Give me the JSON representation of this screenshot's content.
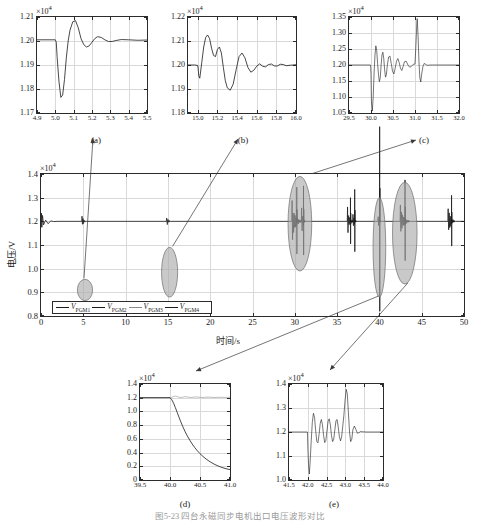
{
  "figure": {
    "caption": "图5-23 四台永磁同步电机出口电压波形对比",
    "panel_labels": {
      "a": "(a)",
      "b": "(b)",
      "c": "(c)",
      "d": "(d)",
      "e": "(e)"
    }
  },
  "main": {
    "xlabel": "时间/s",
    "ylabel": "电压/V",
    "exponent": "×10",
    "exponent_sup": "4",
    "legend": [
      {
        "label": "V",
        "sub": "PGM1"
      },
      {
        "label": "V",
        "sub": "PGM2"
      },
      {
        "label": "V",
        "sub": "PGM3"
      },
      {
        "label": "V",
        "sub": "PGM4"
      }
    ]
  },
  "chart_data": [
    {
      "type": "line",
      "name": "main",
      "title": "",
      "xlabel": "时间/s",
      "ylabel": "电压/V",
      "y_exponent": 10000,
      "xlim": [
        0,
        50
      ],
      "ylim": [
        0.8,
        1.4
      ],
      "xticks": [
        0,
        5,
        10,
        15,
        20,
        25,
        30,
        35,
        40,
        45,
        50
      ],
      "yticks": [
        0.8,
        0.9,
        1.0,
        1.1,
        1.2,
        1.3,
        1.4
      ],
      "grid": true,
      "legend_position": "lower-left",
      "series": [
        {
          "name": "V_PGM1",
          "nominal": 1.2
        },
        {
          "name": "V_PGM2",
          "nominal": 1.2
        },
        {
          "name": "V_PGM3",
          "nominal": 1.2
        },
        {
          "name": "V_PGM4",
          "nominal": 1.2
        }
      ],
      "steady_value": 1.2,
      "disturbance_events_s": [
        0.2,
        5.05,
        15.1,
        30.2,
        31.0,
        36.5,
        37.0,
        40.0,
        43.0,
        48.5
      ],
      "annotations": [
        {
          "shape": "ellipse",
          "cx": 5.2,
          "cy": 0.91,
          "rx": 0.9,
          "ry": 0.045,
          "links_to": "(a)"
        },
        {
          "shape": "ellipse",
          "cx": 15.2,
          "cy": 0.985,
          "rx": 0.95,
          "ry": 0.105,
          "links_to": "(b)"
        },
        {
          "shape": "ellipse",
          "cx": 30.6,
          "cy": 1.19,
          "rx": 1.4,
          "ry": 0.2,
          "links_to": "(c)"
        },
        {
          "shape": "ellipse",
          "cx": 40.0,
          "cy": 1.09,
          "rx": 0.75,
          "ry": 0.21,
          "links_to": "(d)"
        },
        {
          "shape": "ellipse",
          "cx": 43.0,
          "cy": 1.15,
          "rx": 1.45,
          "ry": 0.215,
          "links_to": "(e)"
        }
      ]
    },
    {
      "type": "line",
      "name": "a",
      "panel": "(a)",
      "xlabel": "",
      "ylabel": "",
      "y_exponent": 10000,
      "xlim": [
        4.9,
        5.5
      ],
      "ylim": [
        1.17,
        1.21
      ],
      "xticks": [
        4.9,
        5.0,
        5.1,
        5.2,
        5.3,
        5.4,
        5.5
      ],
      "yticks": [
        1.17,
        1.18,
        1.19,
        1.2,
        1.21
      ],
      "grid": true,
      "points": [
        [
          4.9,
          1.2005
        ],
        [
          4.96,
          1.2005
        ],
        [
          5.0,
          1.2005
        ],
        [
          5.005,
          1.1995
        ],
        [
          5.01,
          1.193
        ],
        [
          5.02,
          1.183
        ],
        [
          5.03,
          1.1765
        ],
        [
          5.04,
          1.1775
        ],
        [
          5.05,
          1.184
        ],
        [
          5.06,
          1.193
        ],
        [
          5.07,
          1.2
        ],
        [
          5.08,
          1.2045
        ],
        [
          5.095,
          1.208
        ],
        [
          5.11,
          1.2085
        ],
        [
          5.125,
          1.2055
        ],
        [
          5.14,
          1.201
        ],
        [
          5.155,
          1.1985
        ],
        [
          5.17,
          1.1975
        ],
        [
          5.185,
          1.198
        ],
        [
          5.2,
          1.1995
        ],
        [
          5.215,
          1.201
        ],
        [
          5.23,
          1.2018
        ],
        [
          5.25,
          1.2015
        ],
        [
          5.27,
          1.2005
        ],
        [
          5.29,
          1.1998
        ],
        [
          5.31,
          1.1998
        ],
        [
          5.33,
          1.2002
        ],
        [
          5.36,
          1.2006
        ],
        [
          5.4,
          1.2005
        ],
        [
          5.45,
          1.2003
        ],
        [
          5.5,
          1.2004
        ]
      ]
    },
    {
      "type": "line",
      "name": "b",
      "panel": "(b)",
      "xlabel": "",
      "ylabel": "",
      "y_exponent": 10000,
      "xlim": [
        14.9,
        16.0
      ],
      "ylim": [
        1.18,
        1.22
      ],
      "xticks": [
        15.0,
        15.2,
        15.4,
        15.6,
        15.8,
        16.0
      ],
      "yticks": [
        1.18,
        1.19,
        1.2,
        1.21,
        1.22
      ],
      "grid": true,
      "points": [
        [
          14.9,
          1.2
        ],
        [
          14.97,
          1.2
        ],
        [
          15.0,
          1.1998
        ],
        [
          15.01,
          1.1955
        ],
        [
          15.02,
          1.1945
        ],
        [
          15.04,
          1.201
        ],
        [
          15.06,
          1.2075
        ],
        [
          15.08,
          1.2115
        ],
        [
          15.1,
          1.2125
        ],
        [
          15.12,
          1.211
        ],
        [
          15.14,
          1.207
        ],
        [
          15.16,
          1.204
        ],
        [
          15.18,
          1.2035
        ],
        [
          15.2,
          1.2065
        ],
        [
          15.22,
          1.2075
        ],
        [
          15.24,
          1.205
        ],
        [
          15.26,
          1.199
        ],
        [
          15.28,
          1.1935
        ],
        [
          15.3,
          1.1905
        ],
        [
          15.33,
          1.1895
        ],
        [
          15.36,
          1.192
        ],
        [
          15.39,
          1.198
        ],
        [
          15.42,
          1.2035
        ],
        [
          15.45,
          1.205
        ],
        [
          15.48,
          1.203
        ],
        [
          15.51,
          1.199
        ],
        [
          15.54,
          1.197
        ],
        [
          15.57,
          1.1978
        ],
        [
          15.6,
          1.1995
        ],
        [
          15.63,
          1.2005
        ],
        [
          15.66,
          1.1995
        ],
        [
          15.69,
          1.1992
        ],
        [
          15.72,
          1.2002
        ],
        [
          15.75,
          1.2004
        ],
        [
          15.78,
          1.1996
        ],
        [
          15.81,
          1.1996
        ],
        [
          15.84,
          1.2003
        ],
        [
          15.87,
          1.2002
        ],
        [
          15.9,
          1.1997
        ],
        [
          15.94,
          1.1999
        ],
        [
          16.0,
          1.2001
        ]
      ]
    },
    {
      "type": "line",
      "name": "c",
      "panel": "(c)",
      "xlabel": "",
      "ylabel": "",
      "y_exponent": 10000,
      "xlim": [
        29.5,
        32.0
      ],
      "ylim": [
        1.05,
        1.35
      ],
      "xticks": [
        29.5,
        30.0,
        30.5,
        31.0,
        31.5,
        32.0
      ],
      "yticks": [
        1.05,
        1.1,
        1.15,
        1.2,
        1.25,
        1.3,
        1.35
      ],
      "grid": true,
      "points": [
        [
          29.5,
          1.2
        ],
        [
          29.9,
          1.2
        ],
        [
          29.99,
          1.2
        ],
        [
          30.0,
          1.17
        ],
        [
          30.01,
          1.085
        ],
        [
          30.03,
          1.056
        ],
        [
          30.05,
          1.1
        ],
        [
          30.07,
          1.175
        ],
        [
          30.09,
          1.23
        ],
        [
          30.11,
          1.26
        ],
        [
          30.13,
          1.245
        ],
        [
          30.15,
          1.205
        ],
        [
          30.17,
          1.17
        ],
        [
          30.19,
          1.148
        ],
        [
          30.21,
          1.16
        ],
        [
          30.23,
          1.2
        ],
        [
          30.25,
          1.232
        ],
        [
          30.27,
          1.24
        ],
        [
          30.29,
          1.22
        ],
        [
          30.31,
          1.185
        ],
        [
          30.33,
          1.162
        ],
        [
          30.35,
          1.17
        ],
        [
          30.37,
          1.198
        ],
        [
          30.4,
          1.225
        ],
        [
          30.43,
          1.228
        ],
        [
          30.46,
          1.205
        ],
        [
          30.49,
          1.18
        ],
        [
          30.52,
          1.172
        ],
        [
          30.55,
          1.19
        ],
        [
          30.58,
          1.212
        ],
        [
          30.61,
          1.22
        ],
        [
          30.64,
          1.208
        ],
        [
          30.67,
          1.19
        ],
        [
          30.7,
          1.183
        ],
        [
          30.73,
          1.195
        ],
        [
          30.76,
          1.21
        ],
        [
          30.8,
          1.212
        ],
        [
          30.84,
          1.2
        ],
        [
          30.88,
          1.193
        ],
        [
          30.92,
          1.196
        ],
        [
          30.96,
          1.202
        ],
        [
          31.0,
          1.203
        ],
        [
          31.02,
          1.26
        ],
        [
          31.04,
          1.325
        ],
        [
          31.05,
          1.345
        ],
        [
          31.07,
          1.29
        ],
        [
          31.09,
          1.21
        ],
        [
          31.11,
          1.16
        ],
        [
          31.13,
          1.147
        ],
        [
          31.15,
          1.17
        ],
        [
          31.18,
          1.195
        ],
        [
          31.21,
          1.205
        ],
        [
          31.24,
          1.202
        ],
        [
          31.28,
          1.199
        ],
        [
          31.33,
          1.1998
        ],
        [
          31.4,
          1.2
        ],
        [
          31.6,
          1.2
        ],
        [
          32.0,
          1.2
        ]
      ]
    },
    {
      "type": "line",
      "name": "d",
      "panel": "(d)",
      "xlabel": "",
      "ylabel": "",
      "y_exponent": 10000,
      "xlim": [
        39.5,
        41.0
      ],
      "ylim": [
        0,
        1.4
      ],
      "xticks": [
        39.5,
        40.0,
        40.5,
        41.0
      ],
      "yticks": [
        0,
        0.2,
        0.4,
        0.6,
        0.8,
        1.0,
        1.2,
        1.4
      ],
      "grid": true,
      "series": [
        {
          "name": "decaying",
          "points": [
            [
              39.5,
              1.2
            ],
            [
              39.8,
              1.2
            ],
            [
              40.0,
              1.2
            ],
            [
              40.03,
              1.17
            ],
            [
              40.06,
              1.12
            ],
            [
              40.09,
              1.055
            ],
            [
              40.12,
              0.985
            ],
            [
              40.15,
              0.915
            ],
            [
              40.18,
              0.848
            ],
            [
              40.21,
              0.785
            ],
            [
              40.25,
              0.708
            ],
            [
              40.29,
              0.64
            ],
            [
              40.33,
              0.58
            ],
            [
              40.37,
              0.525
            ],
            [
              40.41,
              0.476
            ],
            [
              40.45,
              0.432
            ],
            [
              40.5,
              0.384
            ],
            [
              40.55,
              0.343
            ],
            [
              40.6,
              0.307
            ],
            [
              40.65,
              0.276
            ],
            [
              40.7,
              0.249
            ],
            [
              40.75,
              0.225
            ],
            [
              40.8,
              0.205
            ],
            [
              40.85,
              0.188
            ],
            [
              40.9,
              0.173
            ],
            [
              40.95,
              0.161
            ],
            [
              41.0,
              0.152
            ]
          ]
        },
        {
          "name": "sustained",
          "points": [
            [
              39.5,
              1.2
            ],
            [
              39.9,
              1.2
            ],
            [
              40.0,
              1.2
            ],
            [
              40.03,
              1.205
            ],
            [
              40.06,
              1.218
            ],
            [
              40.09,
              1.224
            ],
            [
              40.12,
              1.218
            ],
            [
              40.15,
              1.208
            ],
            [
              40.18,
              1.203
            ],
            [
              40.21,
              1.207
            ],
            [
              40.24,
              1.214
            ],
            [
              40.27,
              1.215
            ],
            [
              40.3,
              1.209
            ],
            [
              40.34,
              1.204
            ],
            [
              40.38,
              1.206
            ],
            [
              40.42,
              1.211
            ],
            [
              40.46,
              1.21
            ],
            [
              40.5,
              1.205
            ],
            [
              40.55,
              1.204
            ],
            [
              40.6,
              1.207
            ],
            [
              40.65,
              1.208
            ],
            [
              40.7,
              1.205
            ],
            [
              40.75,
              1.204
            ],
            [
              40.8,
              1.206
            ],
            [
              40.86,
              1.206
            ],
            [
              40.92,
              1.2045
            ],
            [
              41.0,
              1.205
            ]
          ]
        }
      ]
    },
    {
      "type": "line",
      "name": "e",
      "panel": "(e)",
      "xlabel": "",
      "ylabel": "",
      "y_exponent": 10000,
      "xlim": [
        41.5,
        44.0
      ],
      "ylim": [
        1.0,
        1.4
      ],
      "xticks": [
        41.5,
        42.0,
        42.5,
        43.0,
        43.5,
        44.0
      ],
      "yticks": [
        1.0,
        1.1,
        1.2,
        1.3,
        1.4
      ],
      "grid": true,
      "points": [
        [
          41.5,
          1.2
        ],
        [
          41.9,
          1.2
        ],
        [
          41.99,
          1.2
        ],
        [
          42.0,
          1.14
        ],
        [
          42.02,
          1.06
        ],
        [
          42.04,
          1.025
        ],
        [
          42.06,
          1.07
        ],
        [
          42.09,
          1.16
        ],
        [
          42.12,
          1.24
        ],
        [
          42.15,
          1.278
        ],
        [
          42.18,
          1.26
        ],
        [
          42.21,
          1.205
        ],
        [
          42.24,
          1.16
        ],
        [
          42.27,
          1.155
        ],
        [
          42.3,
          1.19
        ],
        [
          42.33,
          1.235
        ],
        [
          42.36,
          1.252
        ],
        [
          42.39,
          1.23
        ],
        [
          42.42,
          1.185
        ],
        [
          42.45,
          1.156
        ],
        [
          42.48,
          1.165
        ],
        [
          42.51,
          1.205
        ],
        [
          42.54,
          1.245
        ],
        [
          42.57,
          1.255
        ],
        [
          42.6,
          1.23
        ],
        [
          42.63,
          1.185
        ],
        [
          42.66,
          1.16
        ],
        [
          42.69,
          1.17
        ],
        [
          42.72,
          1.21
        ],
        [
          42.75,
          1.248
        ],
        [
          42.78,
          1.252
        ],
        [
          42.81,
          1.22
        ],
        [
          42.84,
          1.18
        ],
        [
          42.87,
          1.163
        ],
        [
          42.9,
          1.18
        ],
        [
          42.93,
          1.225
        ],
        [
          42.96,
          1.27
        ],
        [
          42.99,
          1.33
        ],
        [
          43.02,
          1.378
        ],
        [
          43.05,
          1.36
        ],
        [
          43.08,
          1.28
        ],
        [
          43.11,
          1.2
        ],
        [
          43.14,
          1.16
        ],
        [
          43.17,
          1.17
        ],
        [
          43.2,
          1.21
        ],
        [
          43.24,
          1.225
        ],
        [
          43.28,
          1.21
        ],
        [
          43.32,
          1.195
        ],
        [
          43.36,
          1.197
        ],
        [
          43.4,
          1.202
        ],
        [
          43.45,
          1.201
        ],
        [
          43.55,
          1.2
        ],
        [
          43.75,
          1.2
        ],
        [
          44.0,
          1.2
        ]
      ]
    }
  ]
}
